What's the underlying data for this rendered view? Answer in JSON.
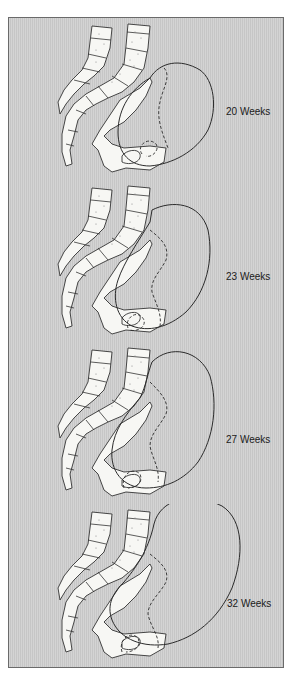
{
  "figure": {
    "type": "anatomical-illustration",
    "frame_background": "#cccccc",
    "panels": [
      {
        "label": "20 Weeks"
      },
      {
        "label": "23 Weeks"
      },
      {
        "label": "27 Weeks"
      },
      {
        "label": "32 Weeks"
      }
    ]
  }
}
